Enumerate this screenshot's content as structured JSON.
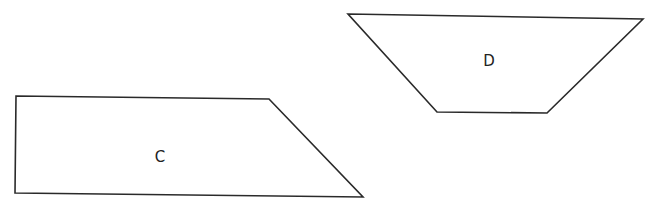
{
  "diagram": {
    "width": 650,
    "height": 209,
    "background": "#ffffff",
    "stroke_color": "#2a2a2a",
    "shapes": [
      {
        "id": "C",
        "label": "C",
        "type": "quadrilateral",
        "points": [
          [
            16,
            96
          ],
          [
            269,
            99
          ],
          [
            363,
            197
          ],
          [
            15,
            193
          ]
        ],
        "label_position": [
          160,
          162
        ]
      },
      {
        "id": "D",
        "label": "D",
        "type": "trapezoid",
        "points": [
          [
            348,
            14
          ],
          [
            643,
            19
          ],
          [
            547,
            113
          ],
          [
            437,
            112
          ]
        ],
        "label_position": [
          489,
          66
        ]
      }
    ]
  }
}
